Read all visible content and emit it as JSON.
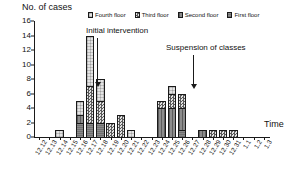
{
  "chart_data": {
    "type": "bar",
    "title": "",
    "ylabel": "No. of cases",
    "xlabel": "Time",
    "ylim": [
      0,
      16
    ],
    "ytick_values": [
      0,
      2,
      4,
      6,
      8,
      10,
      12,
      14,
      16
    ],
    "grid": false,
    "legend_position": "top",
    "stacked": true,
    "categories": [
      "12.12",
      "12.13",
      "12.14",
      "12.15",
      "12.16",
      "12.17",
      "12.18",
      "12.19",
      "12.20",
      "12.21",
      "12.22",
      "12.23",
      "12.24",
      "12.25",
      "12.26",
      "12.27",
      "12.28",
      "12.29",
      "12.30",
      "12.31",
      "1.1",
      "1.2",
      "1.3"
    ],
    "series": [
      {
        "name": "First floor",
        "values": [
          0,
          0,
          0,
          0,
          2,
          2,
          2,
          0,
          0,
          0,
          0,
          0,
          0,
          0,
          1,
          0,
          0,
          0,
          0,
          0,
          0,
          0,
          0
        ]
      },
      {
        "name": "Second floor",
        "values": [
          0,
          0,
          0,
          0,
          1,
          0,
          0,
          0,
          0,
          0,
          0,
          0,
          4,
          4,
          3,
          0,
          1,
          0,
          0,
          0,
          0,
          0,
          0
        ]
      },
      {
        "name": "Third floor",
        "values": [
          0,
          0,
          0,
          0,
          0,
          5,
          3,
          2,
          3,
          0,
          0,
          0,
          1,
          2,
          2,
          0,
          0,
          1,
          1,
          1,
          0,
          0,
          0
        ]
      },
      {
        "name": "Fourth floor",
        "values": [
          0,
          0,
          1,
          0,
          2,
          7,
          3,
          0,
          0,
          1,
          0,
          0,
          0,
          1,
          0,
          0,
          0,
          0,
          0,
          0,
          0,
          0,
          0
        ]
      }
    ],
    "totals": [
      0,
      0,
      1,
      0,
      5,
      14,
      8,
      2,
      3,
      1,
      0,
      0,
      6,
      7,
      6,
      0,
      1,
      1,
      1,
      1,
      0,
      0,
      0
    ],
    "annotations": [
      {
        "text": "Initial intervention",
        "at_category": "12.18"
      },
      {
        "text": "Suspension of classes",
        "at_category": "12.26"
      }
    ]
  },
  "legend": {
    "entries": [
      {
        "label": "Fourth floor"
      },
      {
        "label": "Third floor"
      },
      {
        "label": "Second floor"
      },
      {
        "label": "First floor"
      }
    ]
  },
  "axes": {
    "y_title": "No. of cases",
    "x_title": "Time"
  }
}
